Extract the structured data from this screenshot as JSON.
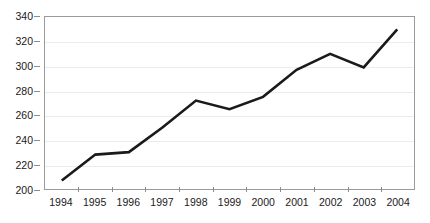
{
  "chart_data": {
    "type": "line",
    "title": "",
    "subtitle": "",
    "xlabel": "",
    "ylabel": "",
    "categories": [
      "1994",
      "1995",
      "1996",
      "1997",
      "1998",
      "1999",
      "2000",
      "2001",
      "2002",
      "2003",
      "2004"
    ],
    "values": [
      207,
      228,
      230,
      250,
      272,
      265,
      275,
      297,
      310,
      299,
      330
    ],
    "series": [
      {
        "name": "",
        "values": [
          207,
          228,
          230,
          250,
          272,
          265,
          275,
          297,
          310,
          299,
          330
        ]
      }
    ],
    "ylim": [
      200,
      340
    ],
    "y_ticks": [
      200,
      220,
      240,
      260,
      280,
      300,
      320,
      340
    ],
    "y_tick_labels": [
      "200",
      "220",
      "240",
      "260",
      "280",
      "300",
      "320",
      "340"
    ],
    "x_tick_labels": [
      "1994",
      "1995",
      "1996",
      "1997",
      "1998",
      "1999",
      "2000",
      "2001",
      "2002",
      "2003",
      "2004"
    ],
    "grid": true,
    "grid_axis": "y",
    "legend": false,
    "legend_position": "none",
    "markers": false,
    "line_color": "#1a1a1a",
    "line_width": 2.6,
    "grid_color": "#ececec",
    "plot_border_color": "#9a9a9a",
    "background_color": "#ffffff",
    "annotations": []
  }
}
